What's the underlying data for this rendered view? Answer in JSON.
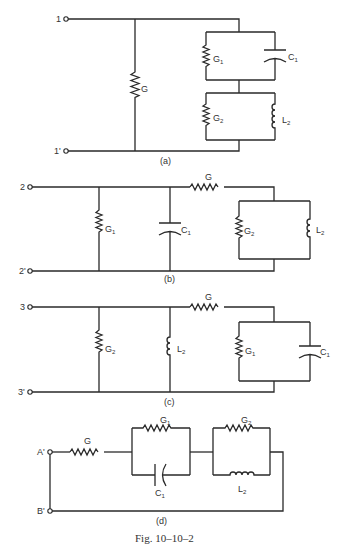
{
  "figure": {
    "caption": "Fig. 10–10–2",
    "panels": [
      {
        "id": "a",
        "label": "(a)",
        "terminals": [
          "1",
          "1'"
        ],
        "components": {
          "G": "G",
          "G1": "G",
          "G1_sub": "1",
          "C1": "C",
          "C1_sub": "1",
          "G2": "G",
          "G2_sub": "2",
          "L2": "L",
          "L2_sub": "2"
        }
      },
      {
        "id": "b",
        "label": "(b)",
        "terminals": [
          "2",
          "2'"
        ],
        "components": {
          "G": "G",
          "G1": "G",
          "G1_sub": "1",
          "C1": "C",
          "C1_sub": "1",
          "G2": "G",
          "G2_sub": "2",
          "L2": "L",
          "L2_sub": "2"
        }
      },
      {
        "id": "c",
        "label": "(c)",
        "terminals": [
          "3",
          "3'"
        ],
        "components": {
          "G": "G",
          "G1": "G",
          "G1_sub": "1",
          "C1": "C",
          "C1_sub": "1",
          "G2": "G",
          "G2_sub": "2",
          "L2": "L",
          "L2_sub": "2"
        }
      },
      {
        "id": "d",
        "label": "(d)",
        "terminals": [
          "A'",
          "B'"
        ],
        "components": {
          "G": "G",
          "G1": "G",
          "G1_sub": "1",
          "C1": "C",
          "C1_sub": "1",
          "G2": "G",
          "G2_sub": "2",
          "L2": "L",
          "L2_sub": "2"
        }
      }
    ]
  }
}
